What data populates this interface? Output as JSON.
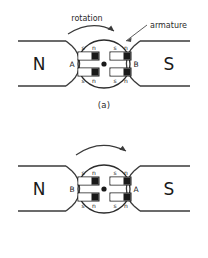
{
  "figure": {
    "stator": {
      "north_label": "N",
      "south_label": "S"
    },
    "annotations": {
      "rotation_label": "rotation",
      "armature_label": "armature"
    },
    "magnet_poles": {
      "south": "s",
      "north": "n"
    },
    "panels": [
      {
        "id": "a",
        "caption": "(a)",
        "left_coil_label": "A",
        "right_coil_label": "B",
        "has_rotation_text": true,
        "magnets": [
          {
            "position": "top-left",
            "left_pole": "s",
            "right_pole": "n"
          },
          {
            "position": "top-right",
            "left_pole": "s",
            "right_pole": "n"
          },
          {
            "position": "bottom-left",
            "left_pole": "s",
            "right_pole": "n"
          },
          {
            "position": "bottom-right",
            "left_pole": "s",
            "right_pole": "n"
          }
        ]
      },
      {
        "id": "b",
        "caption": "(b)",
        "left_coil_label": "B",
        "right_coil_label": "A",
        "has_rotation_text": false,
        "magnets": [
          {
            "position": "top-left",
            "left_pole": "s",
            "right_pole": "n"
          },
          {
            "position": "top-right",
            "left_pole": "s",
            "right_pole": "n"
          },
          {
            "position": "bottom-left",
            "left_pole": "s",
            "right_pole": "n"
          },
          {
            "position": "bottom-right",
            "left_pole": "s",
            "right_pole": "n"
          }
        ]
      }
    ]
  },
  "colors": {
    "line": "#3a3a3a",
    "fill_north": "#1a1a1a",
    "fill_south": "#ffffff",
    "background": "#ffffff",
    "text": "#1a1a1a"
  }
}
